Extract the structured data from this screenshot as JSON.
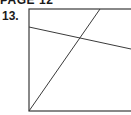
{
  "header": {
    "page_label": "PAGE 12"
  },
  "problem": {
    "number": "13."
  },
  "figure": {
    "stroke_color": "#3a3a3a",
    "rectangle": {
      "x1": 29,
      "y1": 9,
      "x2": 134,
      "y2": 111
    },
    "segments": [
      {
        "name": "diagonal-line",
        "x1": 29,
        "y1": 111,
        "x2": 100,
        "y2": 9
      },
      {
        "name": "transversal-line",
        "x1": 29,
        "y1": 27,
        "x2": 131,
        "y2": 49
      }
    ]
  }
}
